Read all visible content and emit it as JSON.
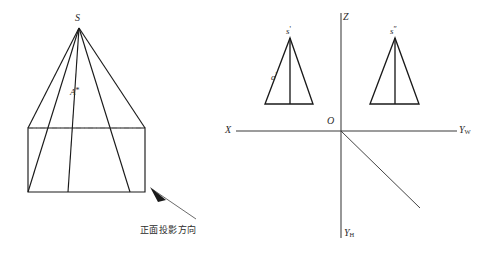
{
  "figure": {
    "title_visible": false,
    "background": "#ffffff",
    "stroke": "#1a1a1a",
    "text_color": "#2b2b2b"
  },
  "left_figure": {
    "name": "pyramid-pictorial",
    "apex_label": "S",
    "face_label": "A",
    "face_label_prime": "*",
    "annotation": "正面投影方向",
    "arrow": "projection-direction-arrow",
    "hidden_edge_style": "dashed"
  },
  "right_figure": {
    "name": "projection-axes",
    "axes": {
      "z_label": "Z",
      "x_label": "X",
      "yw_label": "Y",
      "yw_subscript": "W",
      "yh_label": "Y",
      "yh_subscript": "H",
      "origin_label": "O",
      "diagonal": "45-degree-bisector"
    },
    "front_view": {
      "name": "front-projection-triangle",
      "apex_label": "s",
      "apex_prime": "'",
      "point_label": "a",
      "point_prime": "'"
    },
    "side_view": {
      "name": "side-projection-triangle",
      "apex_label": "s",
      "apex_prime": "″"
    }
  }
}
